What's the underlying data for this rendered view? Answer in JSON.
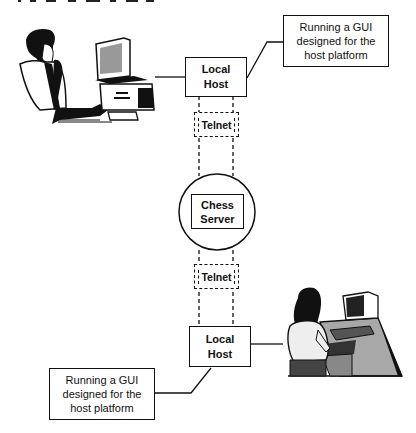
{
  "diagram": {
    "type": "network-architecture",
    "nodes": {
      "top_host": {
        "label_line1": "Local",
        "label_line2": "Host"
      },
      "top_callout": {
        "line1": "Running a GUI",
        "line2": "designed for the",
        "line3": "host platform"
      },
      "top_telnet": {
        "label": "Telnet"
      },
      "server": {
        "label_line1": "Chess",
        "label_line2": "Server"
      },
      "bottom_telnet": {
        "label": "Telnet"
      },
      "bottom_host": {
        "label_line1": "Local",
        "label_line2": "Host"
      },
      "bottom_callout": {
        "line1": "Running a GUI",
        "line2": "designed for the",
        "line3": "host platform"
      }
    },
    "illustrations": {
      "top_left": "man-at-desktop-computer",
      "bottom_right": "woman-at-computer-workstation"
    },
    "colors": {
      "line": "#111111",
      "background": "#ffffff",
      "desk_gray": "#a8a8a8",
      "screen_gray": "#7a7a7a"
    }
  }
}
